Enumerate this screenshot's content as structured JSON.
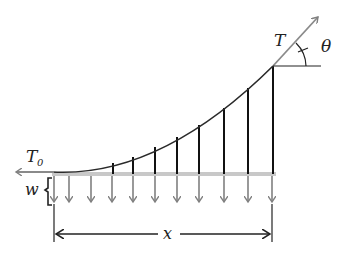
{
  "diagram": {
    "labels": {
      "tension_end": "T",
      "tension_origin": "T",
      "tension_origin_sub": "0",
      "angle": "θ",
      "load": "w",
      "span": "x"
    },
    "colors": {
      "cable": "#2a2a2a",
      "hangers": "#111111",
      "deck": "#c8c8c8",
      "load_arrows": "#808080",
      "tension_arrows": "#8a8a8a",
      "dimension": "#222222"
    },
    "hangers_x": [
      113,
      133,
      155,
      177,
      199,
      224,
      248,
      273
    ],
    "load_arrows_x": [
      54,
      69,
      91,
      112,
      132,
      155,
      177,
      199,
      224,
      248,
      272
    ]
  }
}
